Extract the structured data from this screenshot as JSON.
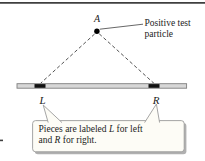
{
  "figure": {
    "point_label": "A",
    "annotation": {
      "line1": "Positive test",
      "line2": "particle"
    },
    "left_piece_label": "L",
    "right_piece_label": "R",
    "callout": {
      "line1": [
        {
          "t": "Pieces are labeled "
        },
        {
          "t": "L",
          "italic": true
        },
        {
          "t": " for left"
        }
      ],
      "line2": [
        {
          "t": "and "
        },
        {
          "t": "R",
          "italic": true
        },
        {
          "t": " for right."
        }
      ]
    },
    "colors": {
      "background": "#ffffff",
      "top_rule": "#3f3f3f",
      "line": "#404040",
      "rod_fill": "#d7d7d7",
      "rod_stroke": "#7f7f7f",
      "piece_fill": "#121212",
      "particle_fill": "#000000",
      "callout_fill": "#fdfcf6",
      "callout_border": "#9b9b9b",
      "callout_shadow": "#b0b0b0",
      "text": "#1c1c1c"
    }
  }
}
